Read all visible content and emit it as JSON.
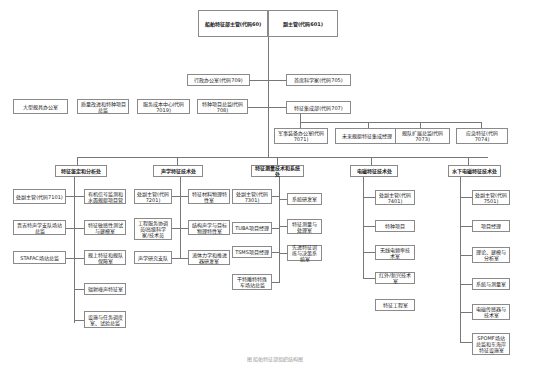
{
  "chart": {
    "top": {
      "left": "船舶特征部主管(代码60)",
      "right": "副主管(代码601)"
    },
    "staff_left": [
      {
        "label": "行政办公室(代码709)"
      }
    ],
    "staff_right": [
      {
        "label": "首席科学家(代码705)"
      },
      {
        "label": "特征集成部(代码707)"
      }
    ],
    "row2_left": [
      {
        "label": "大型舰具办公室"
      },
      {
        "label": "质量改进和特种项目总监"
      },
      {
        "label": "服务成本中心(代码7019)"
      },
      {
        "label": "特种项目总监(代码708)"
      }
    ],
    "integration_children": [
      {
        "label": "军事装备办公室(代码7071)"
      },
      {
        "label": "未来舰艇特征集成经理"
      },
      {
        "label": "舰队扩展总监(代码7073)"
      },
      {
        "label": "应急特征(代码7074)"
      }
    ],
    "departments": [
      {
        "title": "特征鉴定和分析处",
        "left": [
          {
            "label": "处副主管(代码7101)"
          },
          {
            "label": "晋吉特声学支队场站总监"
          },
          {
            "label": "STAFAC场站总监"
          }
        ],
        "right": [
          {
            "label": "有机信号监测和水面舰艇项目管"
          },
          {
            "label": "特征敏感性测试与建模室"
          },
          {
            "label": "舰上特征和舰队保障室"
          },
          {
            "label": "辐射噪声特征室"
          },
          {
            "label": "设施与任务调度室、试验总监"
          }
        ]
      },
      {
        "title": "声学特征技术处",
        "left": [
          {
            "label": "处副主管(代码7201)"
          },
          {
            "label": "工程服务协调员/高级科学家/技术员"
          },
          {
            "label": "声学研究支队"
          }
        ],
        "right": [
          {
            "label": "特征材料物理特性室"
          },
          {
            "label": "结构声学与目标物理特性室"
          },
          {
            "label": "流体力学和推进器研发室"
          }
        ]
      },
      {
        "title": "特征测量技术和系统处",
        "left": [
          {
            "label": "处副主管(代码7301)"
          },
          {
            "label": "TUBA项目经理"
          },
          {
            "label": "TSMS项目经理"
          },
          {
            "label": "干特雕特特殊车场站总监"
          }
        ],
        "right": [
          {
            "label": "系统研发室"
          },
          {
            "label": "特征测量与处理室"
          },
          {
            "label": "先进特征训练与决策系统室"
          }
        ]
      },
      {
        "title": "电磁特征技术处",
        "items": [
          {
            "label": "处副主管(代码7401)"
          },
          {
            "label": "特种项目"
          },
          {
            "label": "无线电频率技术室"
          },
          {
            "label": "红外/新兴技术室"
          },
          {
            "label": "特征工程室"
          }
        ]
      },
      {
        "title": "水下电磁特征技术处",
        "items": [
          {
            "label": "处副主管(代码7501)"
          },
          {
            "label": "项目经理"
          },
          {
            "label": "理论、建模与分析室"
          },
          {
            "label": "系统与测量室"
          },
          {
            "label": "电磁传感器与技术室"
          },
          {
            "label": "SPOMF场站总监和东海岸特征设施室"
          }
        ]
      }
    ],
    "caption": "图  船舶特征部组织结构图"
  }
}
